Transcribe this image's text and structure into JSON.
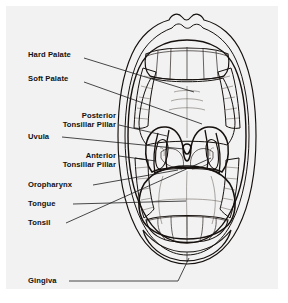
{
  "figure": {
    "background_color": "#ffffff",
    "panel_color": "#f2f2f2",
    "ink_color": "#15100d",
    "leader_color": "#1a1a1a"
  },
  "labels": [
    {
      "id": "hard-palate",
      "text": "Hard Palate",
      "text2": "",
      "x": 22,
      "y": 51,
      "align": "start"
    },
    {
      "id": "soft-palate",
      "text": "Soft Palate",
      "text2": "",
      "x": 22,
      "y": 75,
      "align": "start"
    },
    {
      "id": "posterior-tonsillar-pillar",
      "text": "Posterior",
      "text2": "Tonsillar Pillar",
      "x": 110,
      "y": 112,
      "align": "end"
    },
    {
      "id": "uvula",
      "text": "Uvula",
      "text2": "",
      "x": 22,
      "y": 133,
      "align": "start"
    },
    {
      "id": "anterior-tonsillar-pillar",
      "text": "Anterior",
      "text2": "Tonsillar Pillar",
      "x": 110,
      "y": 155,
      "align": "end"
    },
    {
      "id": "oropharynx",
      "text": "Oropharynx",
      "text2": "",
      "x": 22,
      "y": 181,
      "align": "start"
    },
    {
      "id": "tongue",
      "text": "Tongue",
      "text2": "",
      "x": 22,
      "y": 200,
      "align": "start"
    },
    {
      "id": "tonsil",
      "text": "Tonsil",
      "text2": "",
      "x": 22,
      "y": 219,
      "align": "start"
    },
    {
      "id": "gingiva",
      "text": "Gingiva",
      "text2": "",
      "x": 22,
      "y": 277,
      "align": "start"
    }
  ],
  "structures": [
    {
      "id": "lips",
      "name": "Lips"
    },
    {
      "id": "upper-teeth",
      "name": "Upper teeth"
    },
    {
      "id": "lower-teeth",
      "name": "Lower teeth"
    },
    {
      "id": "hard-palate-area",
      "name": "Hard palate"
    },
    {
      "id": "soft-palate-area",
      "name": "Soft palate"
    },
    {
      "id": "uvula-shape",
      "name": "Uvula"
    },
    {
      "id": "tongue-body",
      "name": "Tongue"
    },
    {
      "id": "tonsil-left",
      "name": "Left tonsil"
    },
    {
      "id": "tonsil-right",
      "name": "Right tonsil"
    },
    {
      "id": "oropharynx-area",
      "name": "Oropharynx"
    },
    {
      "id": "gingiva-area",
      "name": "Gingiva"
    }
  ]
}
